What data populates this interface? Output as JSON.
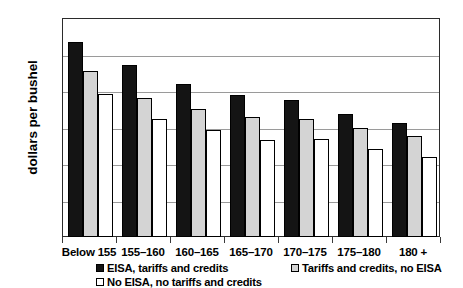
{
  "chart_data": {
    "type": "bar",
    "title": "",
    "xlabel": "",
    "ylabel": "dollars per bushel",
    "ylim": [
      2.0,
      5.0
    ],
    "ytick_labels": [
      "5.00",
      "4.50",
      "4.00",
      "3.50",
      "3.00",
      "2.50",
      "2.00"
    ],
    "ytick_values": [
      5.0,
      4.5,
      4.0,
      3.5,
      3.0,
      2.5,
      2.0
    ],
    "grid": true,
    "legend_position": "bottom",
    "categories": [
      "Below 155",
      "155–160",
      "160–165",
      "165–170",
      "170–175",
      "175–180",
      "180 +"
    ],
    "series": [
      {
        "name": "EISA, tariffs and credits",
        "swatch": "black",
        "values": [
          4.67,
          4.36,
          4.09,
          3.95,
          3.88,
          3.68,
          3.56
        ]
      },
      {
        "name": "Tariffs and credits, no EISA",
        "swatch": "gray",
        "values": [
          4.28,
          3.91,
          3.76,
          3.64,
          3.62,
          3.5,
          3.38
        ]
      },
      {
        "name": "No EISA, no tariffs and credits",
        "swatch": "white",
        "values": [
          3.96,
          3.61,
          3.46,
          3.33,
          3.34,
          3.2,
          3.09
        ]
      }
    ]
  },
  "legend": {
    "entries": [
      {
        "label": "EISA, tariffs and credits",
        "swatch": "s0"
      },
      {
        "label": "No EISA, no tariffs and credits",
        "swatch": "s2"
      },
      {
        "label": "Tariffs and credits, no EISA",
        "swatch": "s1"
      }
    ]
  },
  "colors": {
    "series_black": "#141414",
    "series_gray": "#d4d4d4",
    "series_white": "#ffffff",
    "gridline": "#9a9a9a",
    "frame": "#2b2b2b"
  }
}
